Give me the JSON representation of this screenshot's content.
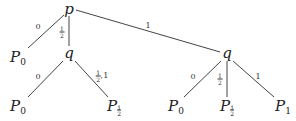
{
  "diagram": {
    "type": "probability-tree",
    "nodes": [
      {
        "id": "root",
        "label": "p",
        "x": 69,
        "y": 9
      },
      {
        "id": "q-left",
        "label": "q",
        "x": 69,
        "y": 53
      },
      {
        "id": "q-right",
        "label": "q",
        "x": 227,
        "y": 53
      },
      {
        "id": "leaf-root-0",
        "base": "P",
        "sub": "0",
        "x": 18,
        "y": 58
      },
      {
        "id": "leaf-ql-0",
        "base": "P",
        "sub": "0",
        "x": 18,
        "y": 107
      },
      {
        "id": "leaf-ql-half",
        "base": "P",
        "sub_num": "1",
        "sub_den": "2",
        "x": 114,
        "y": 107
      },
      {
        "id": "leaf-qr-0",
        "base": "P",
        "sub": "0",
        "x": 176,
        "y": 107
      },
      {
        "id": "leaf-qr-half",
        "base": "P",
        "sub_num": "1",
        "sub_den": "2",
        "x": 227,
        "y": 107
      },
      {
        "id": "leaf-qr-1",
        "base": "P",
        "sub": "1",
        "x": 283,
        "y": 107
      }
    ],
    "edges": [
      {
        "from": "root",
        "to": "leaf-root-0",
        "x1": 64,
        "y1": 15,
        "x2": 28,
        "y2": 48,
        "label": "0",
        "lx": 38,
        "ly": 27
      },
      {
        "from": "root",
        "to": "q-left",
        "x1": 69,
        "y1": 16,
        "x2": 69,
        "y2": 46,
        "label_num": "1",
        "label_den": "2",
        "lx": 62,
        "ly": 32
      },
      {
        "from": "root",
        "to": "q-right",
        "x1": 76,
        "y1": 10,
        "x2": 220,
        "y2": 52,
        "label": "1",
        "lx": 148,
        "ly": 26
      },
      {
        "from": "q-left",
        "to": "leaf-ql-0",
        "x1": 63,
        "y1": 61,
        "x2": 28,
        "y2": 97,
        "label": "0",
        "lx": 38,
        "ly": 77
      },
      {
        "from": "q-left",
        "to": "leaf-ql-half",
        "x1": 75,
        "y1": 61,
        "x2": 108,
        "y2": 97,
        "label_num": "1",
        "label_den": "2",
        "label_suffix": ",1",
        "lx": 102,
        "ly": 76
      },
      {
        "from": "q-right",
        "to": "leaf-qr-0",
        "x1": 221,
        "y1": 61,
        "x2": 184,
        "y2": 97,
        "label": "0",
        "lx": 193,
        "ly": 77
      },
      {
        "from": "q-right",
        "to": "leaf-qr-half",
        "x1": 227,
        "y1": 61,
        "x2": 227,
        "y2": 97,
        "label_num": "1",
        "label_den": "2",
        "lx": 220,
        "ly": 79
      },
      {
        "from": "q-right",
        "to": "leaf-qr-1",
        "x1": 233,
        "y1": 61,
        "x2": 274,
        "y2": 97,
        "label": "1",
        "lx": 258,
        "ly": 77
      }
    ],
    "colors": {
      "line": "#444444",
      "text": "#222222",
      "background": "#ffffff"
    }
  }
}
